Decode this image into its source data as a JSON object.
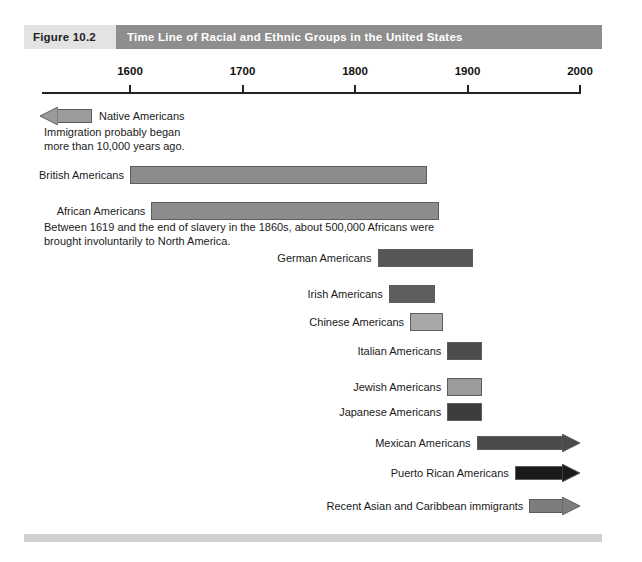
{
  "figure": {
    "number_label": "Figure 10.2",
    "title": "Time Line of Racial and Ethnic Groups in the United States"
  },
  "axis": {
    "ticks": [
      "1600",
      "1700",
      "1800",
      "1900",
      "2000"
    ],
    "start_year": 1600,
    "end_year": 2000
  },
  "notes": {
    "native": "Immigration probably began\nmore than 10,000 years ago.",
    "african": "Between 1619 and the end of slavery in the 1860s, about 500,000 Africans were\nbrought involuntarily to North America."
  },
  "rows": [
    {
      "label": "Native Americans",
      "label_side": "right",
      "shape": "arrow-left",
      "start_year": 1600,
      "end_year": 1645,
      "color": "#9b9b9b"
    },
    {
      "label": "British Americans",
      "label_side": "left",
      "shape": "bar",
      "start_year": 1600,
      "end_year": 1864,
      "color": "#8c8c8c"
    },
    {
      "label": "African Americans",
      "label_side": "left",
      "shape": "bar",
      "start_year": 1619,
      "end_year": 1875,
      "color": "#8c8c8c"
    },
    {
      "label": "German Americans",
      "label_side": "left",
      "shape": "bar",
      "start_year": 1820,
      "end_year": 1905,
      "color": "#575757"
    },
    {
      "label": "Irish Americans",
      "label_side": "left",
      "shape": "bar",
      "start_year": 1830,
      "end_year": 1871,
      "color": "#5e5e5e"
    },
    {
      "label": "Chinese Americans",
      "label_side": "left",
      "shape": "bar",
      "start_year": 1849,
      "end_year": 1878,
      "color": "#a8a8a8"
    },
    {
      "label": "Italian Americans",
      "label_side": "left",
      "shape": "bar",
      "start_year": 1882,
      "end_year": 1913,
      "color": "#4d4d4d"
    },
    {
      "label": "Jewish Americans",
      "label_side": "left",
      "shape": "bar",
      "start_year": 1882,
      "end_year": 1913,
      "color": "#9b9b9b"
    },
    {
      "label": "Japanese Americans",
      "label_side": "left",
      "shape": "bar",
      "start_year": 1882,
      "end_year": 1913,
      "color": "#3d3d3d"
    },
    {
      "label": "Mexican Americans",
      "label_side": "left",
      "shape": "arrow-right",
      "start_year": 1908,
      "end_year": 2000,
      "color": "#4a4a4a"
    },
    {
      "label": "Puerto Rican Americans",
      "label_side": "left",
      "shape": "arrow-right",
      "start_year": 1942,
      "end_year": 2000,
      "color": "#1a1a1a"
    },
    {
      "label": "Recent Asian and Caribbean immigrants",
      "label_side": "left",
      "shape": "arrow-right",
      "start_year": 1955,
      "end_year": 2000,
      "color": "#7d7d7d"
    }
  ],
  "chart_data": {
    "type": "bar",
    "title": "Time Line of Racial and Ethnic Groups in the United States",
    "xlabel": "",
    "ylabel": "",
    "orientation": "horizontal-timeline",
    "xlim": [
      1600,
      2000
    ],
    "xticks": [
      1600,
      1700,
      1800,
      1900,
      2000
    ],
    "grid": false,
    "legend": "none",
    "categories": [
      "Native Americans",
      "British Americans",
      "African Americans",
      "German Americans",
      "Irish Americans",
      "Chinese Americans",
      "Italian Americans",
      "Jewish Americans",
      "Japanese Americans",
      "Mexican Americans",
      "Puerto Rican Americans",
      "Recent Asian and Caribbean immigrants"
    ],
    "spans": [
      {
        "category": "Native Americans",
        "start": 1600,
        "end": 1645,
        "open_start": true,
        "open_end": false
      },
      {
        "category": "British Americans",
        "start": 1600,
        "end": 1864,
        "open_start": false,
        "open_end": false
      },
      {
        "category": "African Americans",
        "start": 1619,
        "end": 1875,
        "open_start": false,
        "open_end": false
      },
      {
        "category": "German Americans",
        "start": 1820,
        "end": 1905,
        "open_start": false,
        "open_end": false
      },
      {
        "category": "Irish Americans",
        "start": 1830,
        "end": 1871,
        "open_start": false,
        "open_end": false
      },
      {
        "category": "Chinese Americans",
        "start": 1849,
        "end": 1878,
        "open_start": false,
        "open_end": false
      },
      {
        "category": "Italian Americans",
        "start": 1882,
        "end": 1913,
        "open_start": false,
        "open_end": false
      },
      {
        "category": "Jewish Americans",
        "start": 1882,
        "end": 1913,
        "open_start": false,
        "open_end": false
      },
      {
        "category": "Japanese Americans",
        "start": 1882,
        "end": 1913,
        "open_start": false,
        "open_end": false
      },
      {
        "category": "Mexican Americans",
        "start": 1908,
        "end": 2000,
        "open_start": false,
        "open_end": true
      },
      {
        "category": "Puerto Rican Americans",
        "start": 1942,
        "end": 2000,
        "open_start": false,
        "open_end": true
      },
      {
        "category": "Recent Asian and Caribbean immigrants",
        "start": 1955,
        "end": 2000,
        "open_start": false,
        "open_end": true
      }
    ],
    "annotations": [
      "Immigration probably began more than 10,000 years ago.",
      "Between 1619 and the end of slavery in the 1860s, about 500,000 Africans were brought involuntarily to North America."
    ]
  }
}
